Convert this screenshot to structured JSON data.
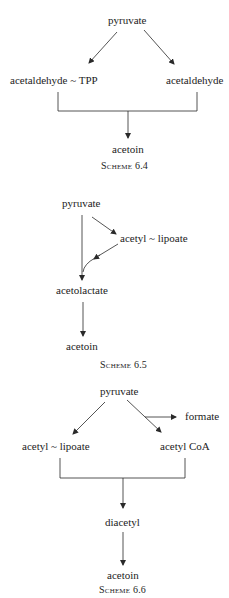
{
  "scheme_6_4": {
    "caption": "Scheme 6.4",
    "nodes": {
      "pyruvate": "pyruvate",
      "acetaldehyde_tpp": "acetaldehyde ~ TPP",
      "acetaldehyde": "acetaldehyde",
      "acetoin": "acetoin"
    },
    "edges": [
      {
        "from": "pyruvate",
        "to": "acetaldehyde ~ TPP"
      },
      {
        "from": "pyruvate",
        "to": "acetaldehyde"
      },
      {
        "from": [
          "acetaldehyde ~ TPP",
          "acetaldehyde"
        ],
        "to": "acetoin"
      }
    ]
  },
  "scheme_6_5": {
    "caption": "Scheme 6.5",
    "nodes": {
      "pyruvate": "pyruvate",
      "acetyl_lipoate": "acetyl ~ lipoate",
      "acetolactate": "acetolactate",
      "acetoin": "acetoin"
    },
    "edges": [
      {
        "from": "pyruvate",
        "to": "acetyl ~ lipoate"
      },
      {
        "from": [
          "pyruvate",
          "acetyl ~ lipoate"
        ],
        "to": "acetolactate"
      },
      {
        "from": "acetolactate",
        "to": "acetoin"
      }
    ]
  },
  "scheme_6_6": {
    "caption": "Scheme 6.6",
    "nodes": {
      "pyruvate": "pyruvate",
      "formate": "formate",
      "acetyl_lipoate": "acetyl ~ lipoate",
      "acetyl_coa": "acetyl CoA",
      "diacetyl": "diacetyl",
      "acetoin": "acetoin"
    },
    "edges": [
      {
        "from": "pyruvate",
        "to": "acetyl ~ lipoate"
      },
      {
        "from": "pyruvate",
        "to": "acetyl CoA"
      },
      {
        "from": "pyruvate",
        "to": "formate"
      },
      {
        "from": [
          "acetyl ~ lipoate",
          "acetyl CoA"
        ],
        "to": "diacetyl"
      },
      {
        "from": "diacetyl",
        "to": "acetoin"
      }
    ]
  },
  "colors": {
    "ink": "#1c1c1c",
    "background": "#ffffff"
  }
}
